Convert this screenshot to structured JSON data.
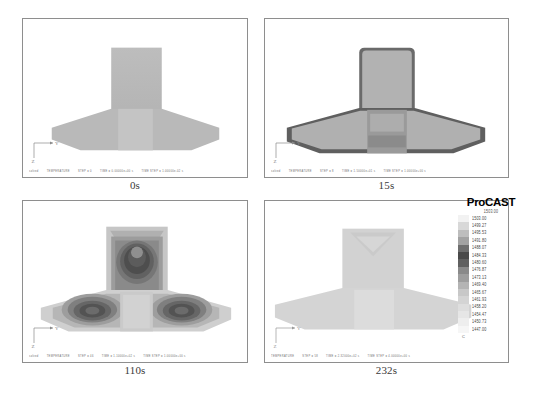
{
  "figure": {
    "software": "ProCAST",
    "field": "TEMPERATURE",
    "axis_labels": {
      "horizontal": "Y",
      "vertical": "Z"
    }
  },
  "panels": [
    {
      "id": "panel-0s",
      "caption": "0s",
      "status": {
        "dataset": "solved",
        "field": "TEMPERATURE",
        "step": "STEP = 0",
        "time": "TIME = 0.00000e+00 s",
        "time_step": "TIME STEP = 1.00000e-02 s"
      },
      "state": "uniform",
      "description": "Uniform initial temperature, sharp cast outline"
    },
    {
      "id": "panel-15s",
      "caption": "15s",
      "status": {
        "dataset": "solved",
        "field": "TEMPERATURE",
        "step": "STEP = 8",
        "time": "TIME = 1.50000e+01 s",
        "time_step": "TIME STEP = 1.00000e+00 s"
      },
      "state": "skin-cooling",
      "description": "Dark cooled skin forming around entire periphery"
    },
    {
      "id": "panel-110s",
      "caption": "110s",
      "status": {
        "dataset": "solved",
        "field": "TEMPERATURE",
        "step": "STEP = 46",
        "time": "TIME = 1.10000e+02 s",
        "time_step": "TIME STEP = 1.00000e+00 s"
      },
      "state": "hot-spots",
      "description": "Three isolated hot spots: riser top and both flange wings"
    },
    {
      "id": "panel-232s",
      "caption": "232s",
      "status": {
        "dataset": "solved",
        "field": "TEMPERATURE",
        "step": "STEP = 58",
        "time": "TIME = 2.32000e+02 s",
        "time_step": "TIME STEP = 4.00000e+00 s"
      },
      "state": "solidified",
      "description": "Fully solidified, shrinkage notch visible in riser"
    }
  ],
  "legend": {
    "title": "ProCAST",
    "top_value": "1503.00",
    "foot_label": "C",
    "bands": [
      {
        "value": "1503.00",
        "color": "#f2f2f2"
      },
      {
        "value": "1499.27",
        "color": "#d8d8d8"
      },
      {
        "value": "1495.53",
        "color": "#bdbdbd"
      },
      {
        "value": "1491.80",
        "color": "#a2a2a2"
      },
      {
        "value": "1488.07",
        "color": "#6e6e6e"
      },
      {
        "value": "1484.33",
        "color": "#4a4a4a"
      },
      {
        "value": "1480.60",
        "color": "#606060"
      },
      {
        "value": "1476.87",
        "color": "#8a8a8a"
      },
      {
        "value": "1473.13",
        "color": "#9e9e9e"
      },
      {
        "value": "1469.40",
        "color": "#b4b4b4"
      },
      {
        "value": "1465.67",
        "color": "#c8c8c8"
      },
      {
        "value": "1461.93",
        "color": "#d4d4d4"
      },
      {
        "value": "1458.20",
        "color": "#dedede"
      },
      {
        "value": "1454.47",
        "color": "#e6e6e6"
      },
      {
        "value": "1450.73",
        "color": "#eeeeee"
      },
      {
        "value": "1447.00",
        "color": "#f6f6f6"
      }
    ]
  }
}
